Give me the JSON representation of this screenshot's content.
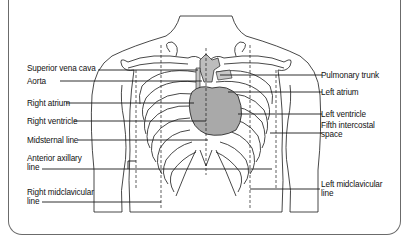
{
  "diagram": {
    "colors": {
      "line": "#1a1a1a",
      "heart_fill": "#a9a9a9",
      "vessel_fill": "#bdbdbd",
      "frame": "#6b6b6b",
      "background": "#ffffff"
    },
    "labels_left": [
      {
        "id": "superior-vena-cava",
        "text": "Superior vena cava"
      },
      {
        "id": "aorta",
        "text": "Aorta"
      },
      {
        "id": "right-atrium",
        "text": "Right atrium"
      },
      {
        "id": "right-ventricle",
        "text": "Right ventricle"
      },
      {
        "id": "midsternal-line",
        "text": "Midsternal line"
      },
      {
        "id": "anterior-axillary-line",
        "text": "Anterior axillary",
        "text2": "line"
      },
      {
        "id": "right-midclavicular-line",
        "text": "Right midclavicular",
        "text2": "line"
      }
    ],
    "labels_right": [
      {
        "id": "pulmonary-trunk",
        "text": "Pulmonary trunk"
      },
      {
        "id": "left-atrium",
        "text": "Left atrium"
      },
      {
        "id": "left-ventricle",
        "text": "Left ventricle"
      },
      {
        "id": "fifth-intercostal-space",
        "text": "Fifth intercostal",
        "text2": "space"
      },
      {
        "id": "left-midclavicular-line",
        "text": "Left midclavicular",
        "text2": "line"
      }
    ]
  }
}
